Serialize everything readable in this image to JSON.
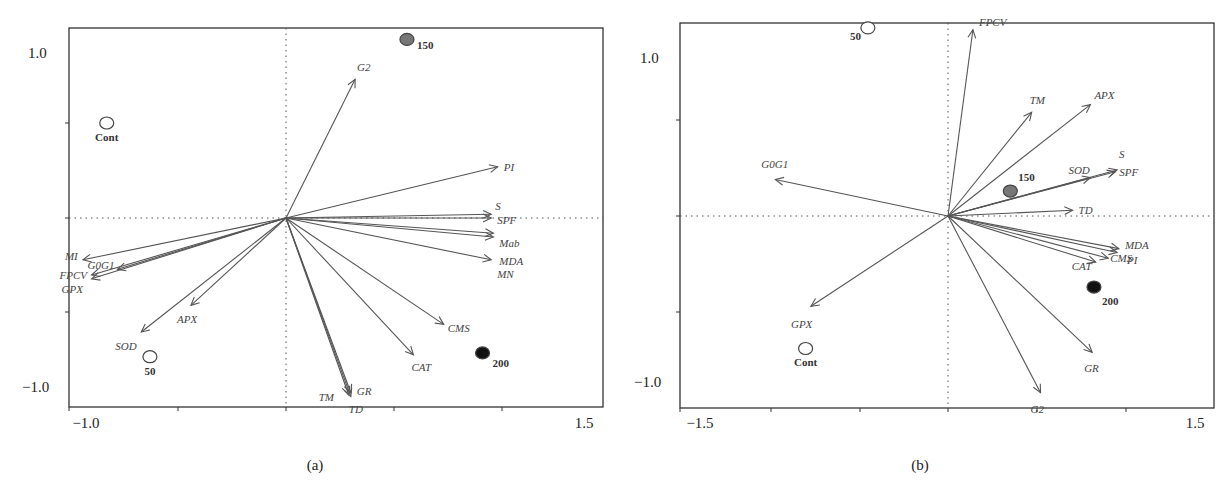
{
  "chart_data": [
    {
      "type": "scatter",
      "subtype": "biplot",
      "panel_label": "(a)",
      "xlim": [
        -1.0,
        1.5
      ],
      "ylim": [
        -1.0,
        1.0
      ],
      "x_tick_labels": [
        "-1.0",
        "1.5"
      ],
      "y_tick_labels": [
        "1.0",
        "-1.0"
      ],
      "grid": false,
      "reference_lines": "dotted lines at x=0 and y=0",
      "vectors": [
        {
          "label": "G2",
          "x": 0.32,
          "y": 0.73
        },
        {
          "label": "PI",
          "x": 0.98,
          "y": 0.27
        },
        {
          "label": "S",
          "x": 0.95,
          "y": 0.02
        },
        {
          "label": "SPF",
          "x": 0.95,
          "y": 0.0
        },
        {
          "label": "Mab",
          "x": 0.96,
          "y": -0.08
        },
        {
          "label": "MDA",
          "x": 0.96,
          "y": -0.1
        },
        {
          "label": "MN",
          "x": 0.95,
          "y": -0.22
        },
        {
          "label": "CMS",
          "x": 0.73,
          "y": -0.56
        },
        {
          "label": "CAT",
          "x": 0.59,
          "y": -0.72
        },
        {
          "label": "GR",
          "x": 0.3,
          "y": -0.92
        },
        {
          "label": "TM",
          "x": 0.29,
          "y": -0.93
        },
        {
          "label": "TD",
          "x": 0.3,
          "y": -0.94
        },
        {
          "label": "MI",
          "x": -0.94,
          "y": -0.22
        },
        {
          "label": "G0G1",
          "x": -0.78,
          "y": -0.27
        },
        {
          "label": "FPCV",
          "x": -0.9,
          "y": -0.3
        },
        {
          "label": "GPX",
          "x": -0.9,
          "y": -0.32
        },
        {
          "label": "APX",
          "x": -0.44,
          "y": -0.46
        },
        {
          "label": "SOD",
          "x": -0.67,
          "y": -0.6
        }
      ],
      "points": [
        {
          "label": "Cont",
          "x": -0.83,
          "y": 0.5,
          "fill": "#ffffff"
        },
        {
          "label": "50",
          "x": -0.63,
          "y": -0.73,
          "fill": "#ffffff"
        },
        {
          "label": "150",
          "x": 0.56,
          "y": 0.94,
          "fill": "#777777"
        },
        {
          "label": "200",
          "x": 0.91,
          "y": -0.71,
          "fill": "#111111"
        }
      ]
    },
    {
      "type": "scatter",
      "subtype": "biplot",
      "panel_label": "(b)",
      "xlim": [
        -1.5,
        1.5
      ],
      "ylim": [
        -1.0,
        1.0
      ],
      "x_tick_labels": [
        "-1.5",
        "1.5"
      ],
      "y_tick_labels": [
        "1.0",
        "-1.0"
      ],
      "grid": false,
      "reference_lines": "dotted lines at x=0 and y=0",
      "vectors": [
        {
          "label": "FPCV",
          "x": 0.14,
          "y": 0.97
        },
        {
          "label": "TM",
          "x": 0.47,
          "y": 0.54
        },
        {
          "label": "APX",
          "x": 0.8,
          "y": 0.58
        },
        {
          "label": "SOD",
          "x": 0.8,
          "y": 0.2
        },
        {
          "label": "S",
          "x": 0.95,
          "y": 0.24
        },
        {
          "label": "SPF",
          "x": 0.94,
          "y": 0.23
        },
        {
          "label": "TD",
          "x": 0.7,
          "y": 0.03
        },
        {
          "label": "G0G1",
          "x": -0.97,
          "y": 0.19
        },
        {
          "label": "GPX",
          "x": -0.77,
          "y": -0.47
        },
        {
          "label": "MDA",
          "x": 0.96,
          "y": -0.17
        },
        {
          "label": "PI",
          "x": 0.95,
          "y": -0.19
        },
        {
          "label": "CAT",
          "x": 0.83,
          "y": -0.24
        },
        {
          "label": "CMS",
          "x": 0.9,
          "y": -0.22
        },
        {
          "label": "GR",
          "x": 0.81,
          "y": -0.71
        },
        {
          "label": "G2",
          "x": 0.52,
          "y": -0.92
        }
      ],
      "points": [
        {
          "label": "50",
          "x": -0.45,
          "y": 0.98,
          "fill": "#ffffff"
        },
        {
          "label": "Cont",
          "x": -0.8,
          "y": -0.69,
          "fill": "#ffffff"
        },
        {
          "label": "150",
          "x": 0.35,
          "y": 0.13,
          "fill": "#777777"
        },
        {
          "label": "200",
          "x": 0.82,
          "y": -0.37,
          "fill": "#111111"
        }
      ]
    }
  ]
}
